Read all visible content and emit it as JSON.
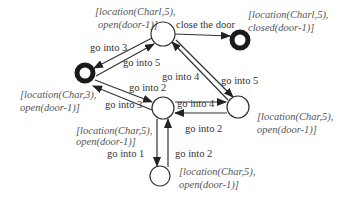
{
  "diagram": {
    "type": "state-transition-graph",
    "colors": {
      "stroke": "#333333",
      "text": "#333333",
      "state_text": "#555555",
      "background": "#ffffff"
    },
    "nodes": [
      {
        "id": "s_top",
        "style": "normal",
        "label_lines": [
          "[location(Charl,5),",
          "open(door-1)]"
        ]
      },
      {
        "id": "s_closed",
        "style": "bold",
        "label_lines": [
          "[location(Charl,5),",
          "closed(door-1)]"
        ]
      },
      {
        "id": "s_char3",
        "style": "bold",
        "label_lines": [
          "[location(Char,3),",
          "open(door-1)]"
        ]
      },
      {
        "id": "s_mid",
        "style": "normal",
        "label_lines": [
          "[location(Char,5),",
          "open(door-1)]"
        ]
      },
      {
        "id": "s_right",
        "style": "normal",
        "label_lines": [
          "[location(Char,5),",
          "open(door-1)]"
        ]
      },
      {
        "id": "s_bottom",
        "style": "normal",
        "label_lines": [
          "[location(Char,5),",
          "open(door-1)]"
        ]
      }
    ],
    "edges": [
      {
        "from": "s_top",
        "to": "s_char3",
        "label": "go into 3"
      },
      {
        "from": "s_char3",
        "to": "s_top",
        "label": "go into 5"
      },
      {
        "from": "s_top",
        "to": "s_closed",
        "label": "close the door"
      },
      {
        "from": "s_right",
        "to": "s_top",
        "label": "go into 4"
      },
      {
        "from": "s_top",
        "to": "s_right",
        "label": "go into 5"
      },
      {
        "from": "s_char3",
        "to": "s_mid",
        "label": "go into 2"
      },
      {
        "from": "s_mid",
        "to": "s_char3",
        "label": "go into 3"
      },
      {
        "from": "s_mid",
        "to": "s_right",
        "label": "go into 4"
      },
      {
        "from": "s_right",
        "to": "s_mid",
        "label": "go into 2"
      },
      {
        "from": "s_mid",
        "to": "s_bottom",
        "label": "go into 1"
      },
      {
        "from": "s_bottom",
        "to": "s_mid",
        "label": "go into 2"
      }
    ]
  }
}
